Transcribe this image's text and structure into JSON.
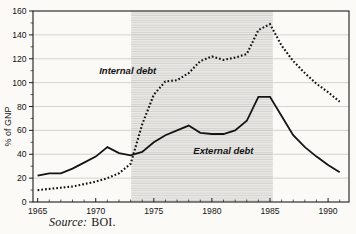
{
  "figure": {
    "source_prefix": "Source:",
    "source_text": "BOI.",
    "colors": {
      "line": "#141414",
      "frame": "#1c1c1c",
      "grid": "#c2c1be",
      "band_bg": "#edebe8",
      "band_stripe": "#d3d1cd",
      "background": "#fbfaf7"
    }
  },
  "chart_data": {
    "type": "line",
    "title": "",
    "xlabel": "",
    "ylabel": "% of GNP",
    "ylim": [
      0,
      160
    ],
    "xlim": [
      1964.6,
      1991.8
    ],
    "ytick_major": 20,
    "ytick_minor": 10,
    "xtick_major": [
      1965,
      1970,
      1975,
      1980,
      1985,
      1990
    ],
    "xtick_minor_step": 1,
    "grid": "horizontal",
    "legend_position": "inline-annotations",
    "shaded_region": {
      "from": 1973.05,
      "to": 1985.25,
      "meaning": "1973-1985"
    },
    "years": [
      1965,
      1966,
      1967,
      1968,
      1969,
      1970,
      1971,
      1972,
      1973,
      1974,
      1975,
      1976,
      1977,
      1978,
      1979,
      1980,
      1981,
      1982,
      1983,
      1984,
      1985,
      1986,
      1987,
      1988,
      1989,
      1990,
      1991
    ],
    "series": [
      {
        "name": "Internal debt",
        "style": "dotted",
        "values": [
          10,
          11,
          12,
          13,
          15,
          17,
          20,
          24,
          32,
          65,
          90,
          101,
          102,
          108,
          118,
          122,
          119,
          121,
          124,
          144,
          149,
          131,
          118,
          108,
          99,
          92,
          84
        ],
        "label_pos": {
          "x": 1970.3,
          "y": 107
        }
      },
      {
        "name": "External debt",
        "style": "solid",
        "values": [
          22,
          24,
          24,
          28,
          33,
          38,
          46,
          41,
          39,
          42,
          50,
          56,
          60,
          64,
          58,
          57,
          57,
          60,
          68,
          88,
          88,
          72,
          56,
          46,
          38,
          31,
          25
        ],
        "label_pos": {
          "x": 1978.4,
          "y": 40
        }
      }
    ]
  }
}
